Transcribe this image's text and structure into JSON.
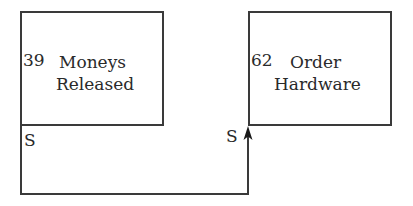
{
  "nodes": [
    {
      "id": "39",
      "line1": "Moneys",
      "line2": "Released"
    },
    {
      "id": "62",
      "line1": "Order",
      "line2": "Hardware"
    }
  ],
  "link": {
    "from": "39",
    "to": "62",
    "from_label": "S",
    "to_label": "S",
    "type": "start-to-start"
  },
  "colors": {
    "stroke": "#3a3a3a",
    "text": "#2a2a2a"
  }
}
